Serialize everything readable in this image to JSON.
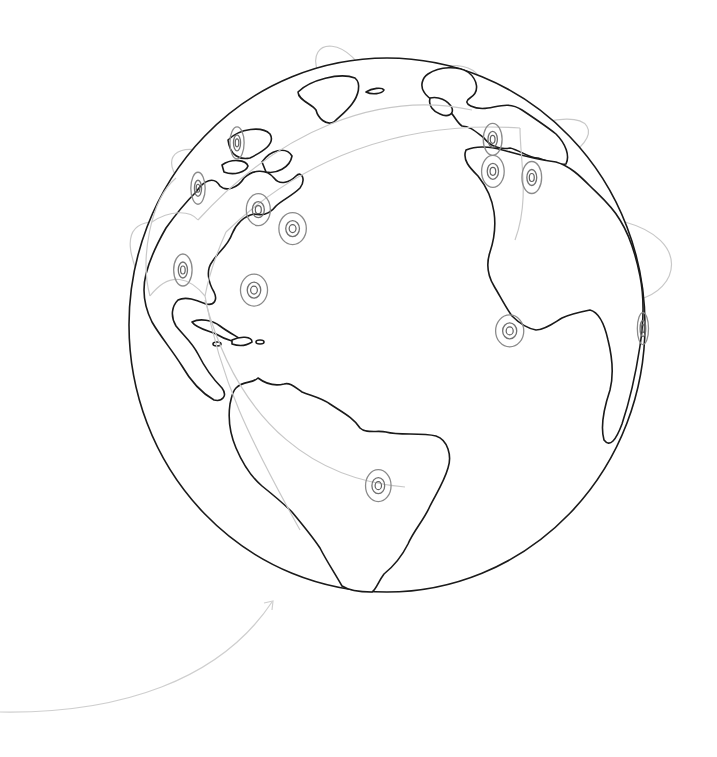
{
  "illustration": {
    "subject": "Wireframe globe with network connection arcs",
    "colors": {
      "background": "#ffffff",
      "land_outline": "#1a1a1a",
      "arc": "#c8c8c8",
      "marker": "#7a7a7a"
    }
  },
  "markers": [
    {
      "id": "brazil",
      "label": "Brazil hub",
      "lon": -47,
      "lat": -15
    },
    {
      "id": "caribbean",
      "label": "Florida / Caribbean hub",
      "lon": -80,
      "lat": 26
    },
    {
      "id": "mexico-west",
      "label": "West Mexico hub",
      "lon": -105,
      "lat": 24
    },
    {
      "id": "us-east",
      "label": "US East Coast hub",
      "lon": -74,
      "lat": 41
    },
    {
      "id": "us-central",
      "label": "US Central hub",
      "lon": -88,
      "lat": 43
    },
    {
      "id": "us-west",
      "label": "US West hub",
      "lon": -118,
      "lat": 40
    },
    {
      "id": "canada-west",
      "label": "West Canada hub",
      "lon": -120,
      "lat": 53
    },
    {
      "id": "west-africa",
      "label": "West Africa hub",
      "lon": -15,
      "lat": 18
    },
    {
      "id": "uk",
      "label": "UK hub",
      "lon": -2,
      "lat": 53
    },
    {
      "id": "scandinavia",
      "label": "Scandinavia hub",
      "lon": 10,
      "lat": 60
    },
    {
      "id": "europe-central",
      "label": "Central Europe hub",
      "lon": 12,
      "lat": 48
    },
    {
      "id": "east-africa",
      "label": "East Africa hub",
      "lon": 38,
      "lat": 2
    }
  ],
  "connections": [
    [
      "brazil",
      "us-east"
    ],
    [
      "caribbean",
      "us-east"
    ],
    [
      "us-east",
      "uk"
    ],
    [
      "us-east",
      "europe-central"
    ],
    [
      "us-central",
      "scandinavia"
    ],
    [
      "us-west",
      "us-east"
    ],
    [
      "canada-west",
      "us-central"
    ],
    [
      "mexico-west",
      "caribbean"
    ],
    [
      "west-africa",
      "europe-central"
    ],
    [
      "uk",
      "scandinavia"
    ],
    [
      "europe-central",
      "east-africa"
    ]
  ]
}
